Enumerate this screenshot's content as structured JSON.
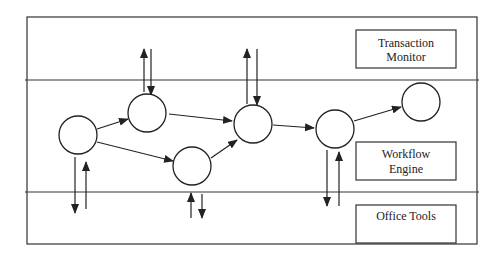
{
  "diagram": {
    "layers": [
      {
        "id": "transaction-monitor",
        "label_lines": [
          "Transaction",
          "Monitor"
        ]
      },
      {
        "id": "workflow-engine",
        "label_lines": [
          "Workflow",
          "Engine"
        ]
      },
      {
        "id": "office-tools",
        "label_lines": [
          "Office Tools"
        ]
      }
    ],
    "nodes": [
      {
        "id": "n1",
        "cx": 78,
        "cy": 135
      },
      {
        "id": "n2",
        "cx": 147,
        "cy": 113
      },
      {
        "id": "n3",
        "cx": 192,
        "cy": 166
      },
      {
        "id": "n4",
        "cx": 253,
        "cy": 124
      },
      {
        "id": "n5",
        "cx": 335,
        "cy": 129
      },
      {
        "id": "n6",
        "cx": 421,
        "cy": 102
      }
    ],
    "edges": [
      {
        "from": "n1",
        "to": "n2"
      },
      {
        "from": "n1",
        "to": "n3"
      },
      {
        "from": "n2",
        "to": "n4"
      },
      {
        "from": "n3",
        "to": "n4"
      },
      {
        "from": "n4",
        "to": "n5"
      },
      {
        "from": "n5",
        "to": "n6"
      }
    ],
    "colors": {
      "stroke": "#222222",
      "background": "#ffffff"
    }
  }
}
